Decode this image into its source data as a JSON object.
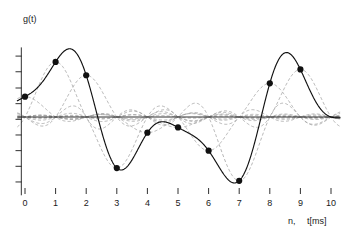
{
  "chart_data": {
    "type": "line",
    "title": "",
    "subtitle": "",
    "ylabel": "g(t)",
    "xlabel_index": "n,",
    "xlabel_time": "t[ms]",
    "x": [
      0,
      1,
      2,
      3,
      4,
      5,
      6,
      7,
      8,
      9,
      10
    ],
    "xticklabels": [
      "0",
      "1",
      "2",
      "3",
      "4",
      "5",
      "6",
      "7",
      "8",
      "9",
      "10"
    ],
    "xlim": [
      -0.25,
      10.3
    ],
    "ylim": [
      -1.35,
      1.2
    ],
    "grid": false,
    "legend": false,
    "yticks_labeled": false,
    "yticks_count": 11,
    "series": [
      {
        "name": "reconstructed signal g(t)",
        "style": "solid",
        "color": "#111111",
        "description": "Whittaker-Shannon sinc interpolation of the samples"
      },
      {
        "name": "weighted sinc kernels",
        "style": "dashed",
        "color": "#9a9a9a",
        "description": "individual g(n)*sinc(t-n) basis functions"
      }
    ],
    "samples": [
      {
        "n": 0,
        "value": 0.35
      },
      {
        "n": 1,
        "value": 0.95
      },
      {
        "n": 2,
        "value": 0.72
      },
      {
        "n": 3,
        "value": -0.88
      },
      {
        "n": 4,
        "value": -0.27
      },
      {
        "n": 5,
        "value": -0.18
      },
      {
        "n": 6,
        "value": -0.58
      },
      {
        "n": 7,
        "value": -1.1
      },
      {
        "n": 8,
        "value": 0.58
      },
      {
        "n": 9,
        "value": 0.82
      },
      {
        "n": 10,
        "value": 0.0
      }
    ],
    "marker": "filled-circle",
    "marker_size": 3.1
  },
  "figure": {
    "background": "#ffffff",
    "axis_color": "#1a1a1a",
    "solid_color": "#111111",
    "dashed_color": "#9a9a9a"
  }
}
